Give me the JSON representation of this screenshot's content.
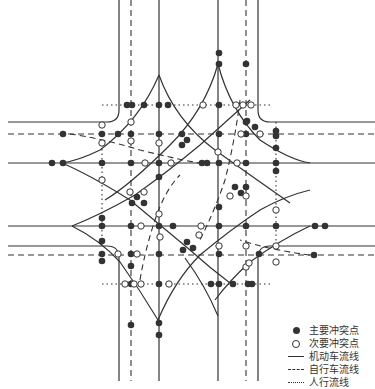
{
  "diagram": {
    "type": "intersection-conflict-points",
    "colors": {
      "line": "#333333",
      "major_point": "#333333",
      "minor_point_fill": "#ffffff"
    }
  },
  "legend": {
    "items": [
      {
        "symbol": "filled-circle",
        "label": "主要冲突点"
      },
      {
        "symbol": "hollow-circle",
        "label": "次要冲突点"
      },
      {
        "symbol": "solid-line",
        "label": "机动车流线"
      },
      {
        "symbol": "dashed-line",
        "label": "自行车流线"
      },
      {
        "symbol": "dotted-line",
        "label": "人行流线"
      }
    ]
  }
}
